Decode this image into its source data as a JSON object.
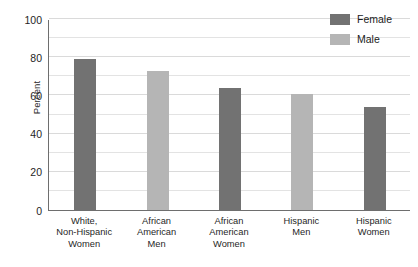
{
  "chart_data": {
    "type": "bar",
    "title": "",
    "xlabel": "",
    "ylabel": "Percent",
    "ylim": [
      0,
      100
    ],
    "ytick_labels": [
      "0",
      "20",
      "40",
      "60",
      "80",
      "100"
    ],
    "ytick_values": [
      0,
      20,
      40,
      60,
      80,
      100
    ],
    "minor_gridline_step": 10,
    "grid": true,
    "legend_position": "top-right",
    "categories": [
      "White,\nNon-Hispanic\nWomen",
      "African\nAmerican\nMen",
      "African\nAmerican\nWomen",
      "Hispanic\nMen",
      "Hispanic\nWomen"
    ],
    "category_lines": [
      [
        "White,",
        "Non-Hispanic",
        "Women"
      ],
      [
        "African",
        "American",
        "Men"
      ],
      [
        "African",
        "American",
        "Women"
      ],
      [
        "Hispanic",
        "Men"
      ],
      [
        "Hispanic",
        "Women"
      ]
    ],
    "values": [
      79,
      73,
      64,
      61,
      54
    ],
    "point_groups": [
      "Female",
      "Male",
      "Female",
      "Male",
      "Female"
    ],
    "series": [
      {
        "name": "Female",
        "color": "#727272",
        "values": [
          79,
          null,
          64,
          null,
          54
        ]
      },
      {
        "name": "Male",
        "color": "#b5b5b5",
        "values": [
          null,
          73,
          null,
          61,
          null
        ]
      }
    ],
    "legend": [
      {
        "label": "Female",
        "color": "#727272"
      },
      {
        "label": "Male",
        "color": "#b5b5b5"
      }
    ]
  },
  "header": {
    "clipped_text": ""
  }
}
